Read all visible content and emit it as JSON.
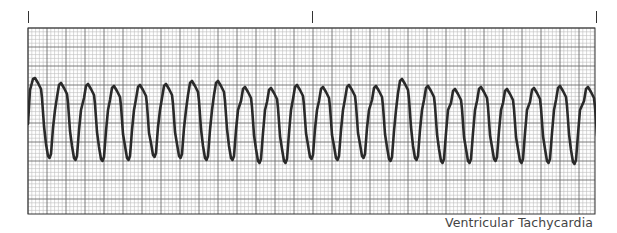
{
  "strip": {
    "caption": "Ventricular Tachycardia",
    "rhythm": "ventricular-tachycardia",
    "timing_marks_x": [
      28,
      312,
      596
    ],
    "grid": {
      "left": 28,
      "top": 28,
      "right": 595,
      "bottom": 214,
      "minor_px": 3.8,
      "major_every": 5,
      "minor_color": "#bdbdbd",
      "major_color": "#6e6e6e",
      "border_color": "#333333"
    },
    "trace": {
      "color": "#2a2a2a",
      "stroke_width": 2.6,
      "start_x": 28,
      "end_x": 595,
      "peak_x": [
        35,
        61,
        88,
        114,
        140,
        166,
        192,
        218,
        245,
        271,
        297,
        323,
        349,
        376,
        402,
        428,
        455,
        481,
        507,
        534,
        560,
        588
      ],
      "peak_y": [
        78,
        83,
        84,
        86,
        85,
        84,
        81,
        81,
        87,
        88,
        85,
        87,
        85,
        86,
        79,
        86,
        89,
        87,
        89,
        88,
        86,
        87
      ],
      "trough_y": [
        158,
        160,
        161,
        160,
        157,
        158,
        160,
        160,
        163,
        163,
        159,
        160,
        158,
        161,
        160,
        163,
        163,
        161,
        163,
        163,
        164,
        160
      ],
      "baseline_y": 120
    }
  }
}
